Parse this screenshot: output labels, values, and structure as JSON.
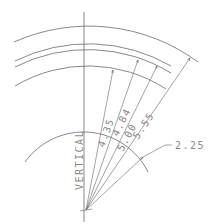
{
  "drawing": {
    "vertical_label": "VERTICAL",
    "inner_radius_label": "2.25",
    "radius_labels": [
      "4.35",
      "4.84",
      "5.00",
      "5.55"
    ],
    "line_color": "#555555",
    "text_color": "#8a8a8a"
  }
}
